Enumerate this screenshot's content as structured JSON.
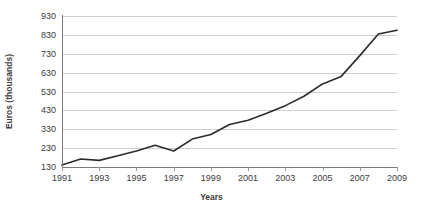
{
  "chart_data": {
    "type": "line",
    "title": "",
    "xlabel": "Years",
    "ylabel": "Euros (thousands)",
    "grid": true,
    "legend": "none",
    "xlim": [
      1991,
      2009
    ],
    "ylim": [
      130,
      930
    ],
    "ytick_labels": [
      "930",
      "830",
      "730",
      "630",
      "530",
      "430",
      "330",
      "230",
      "130"
    ],
    "ytick_values": [
      930,
      830,
      730,
      630,
      530,
      430,
      330,
      230,
      130
    ],
    "xtick_labels": [
      "1991",
      "1993",
      "1995",
      "1997",
      "1999",
      "2001",
      "2003",
      "2005",
      "2007",
      "2009"
    ],
    "xtick_values": [
      1991,
      1993,
      1995,
      1997,
      1999,
      2001,
      2003,
      2005,
      2007,
      2009
    ],
    "x": [
      1991,
      1992,
      1993,
      1994,
      1995,
      1996,
      1997,
      1998,
      1999,
      2000,
      2001,
      2002,
      2003,
      2004,
      2005,
      2006,
      2007,
      2008,
      2009
    ],
    "series": [
      {
        "name": "Euros (thousands)",
        "values": [
          140,
          172,
          165,
          190,
          215,
          245,
          215,
          278,
          302,
          355,
          378,
          415,
          455,
          505,
          570,
          610,
          720,
          835,
          855
        ]
      }
    ],
    "line_color": "#2b2b2b",
    "grid_color": "#cfcfcf",
    "axis_color": "#7a7a7a",
    "text_color": "#3b3b3b",
    "background": "#ffffff"
  }
}
